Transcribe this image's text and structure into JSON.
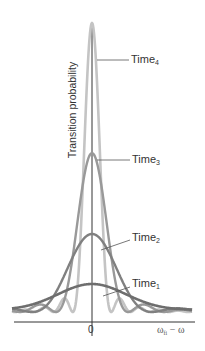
{
  "chart_data": {
    "type": "line",
    "title": "",
    "xlabel": "ω_fi − ω",
    "ylabel": "Transition probability",
    "x_ticks": [
      "0"
    ],
    "grid": false,
    "legend_position": "inline-callouts",
    "series": [
      {
        "name": "Time1",
        "label_base": "Time",
        "label_sub": "1",
        "relative_peak": 0.09,
        "relative_width": 1.0,
        "color": "#6e6e6e",
        "description": "broadest, lowest curve"
      },
      {
        "name": "Time2",
        "label_base": "Time",
        "label_sub": "2",
        "relative_peak": 0.27,
        "relative_width": 0.5,
        "color": "#808080",
        "description": "medium-broad curve"
      },
      {
        "name": "Time3",
        "label_base": "Time",
        "label_sub": "3",
        "relative_peak": 0.55,
        "relative_width": 0.3,
        "color": "#999999",
        "description": "narrower, taller curve"
      },
      {
        "name": "Time4",
        "label_base": "Time",
        "label_sub": "4",
        "relative_peak": 1.0,
        "relative_width": 0.16,
        "color": "#c4c4c4",
        "description": "narrowest, tallest curve with side oscillations"
      }
    ]
  },
  "labels": {
    "ylabel": "Transition probability",
    "x_tick_zero": "0",
    "xlabel_omega": "ω",
    "xlabel_sub": "fi",
    "xlabel_rest": " − ω",
    "time_base": "Time",
    "time1_sub": "1",
    "time2_sub": "2",
    "time3_sub": "3",
    "time4_sub": "4"
  }
}
